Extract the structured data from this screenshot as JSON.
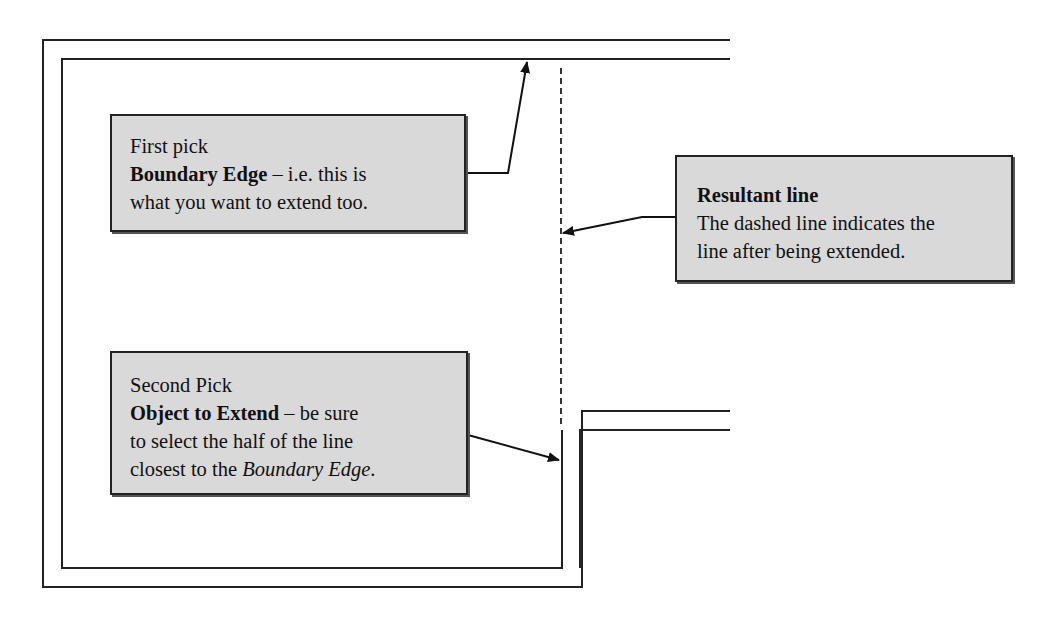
{
  "diagram": {
    "type": "extend-command-illustration",
    "colors": {
      "background": "#ffffff",
      "line": "#222222",
      "callout_fill": "#d9d9d9",
      "callout_border": "#222222"
    }
  },
  "callouts": {
    "first_pick": {
      "title": "First pick",
      "bold_term": "Boundary Edge",
      "rest_line2": " – i.e. this is",
      "line3": "what you want to extend too."
    },
    "resultant": {
      "title": "Resultant line",
      "line2": "The dashed line indicates the",
      "line3": "line after being extended."
    },
    "second_pick": {
      "title": "Second Pick",
      "bold_term": "Object to Extend",
      "rest_line2": " – be sure",
      "line3": "to select the half of the line",
      "line4_prefix": "closest to the ",
      "line4_italic": "Boundary Edge",
      "line4_suffix": "."
    }
  }
}
